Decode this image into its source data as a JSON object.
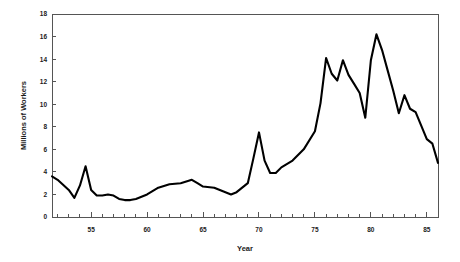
{
  "chart_data": {
    "type": "line",
    "title": "",
    "xlabel": "Year",
    "ylabel": "Millions of Workers",
    "xlim": [
      51.5,
      86.0
    ],
    "ylim": [
      0,
      18
    ],
    "ytick_step": 2,
    "xtick_step": 5,
    "xtick_minor_step": 1,
    "grid": false,
    "legend": "none",
    "yticks": [
      0,
      2,
      4,
      6,
      8,
      10,
      12,
      14,
      16,
      18
    ],
    "ytick_labels": [
      "0",
      "2",
      "4",
      "6",
      "8",
      "10",
      "12",
      "14",
      "16",
      "18"
    ],
    "xticks": [
      55,
      60,
      65,
      70,
      75,
      80,
      85
    ],
    "xtick_labels": [
      "55",
      "60",
      "65",
      "70",
      "75",
      "80",
      "85"
    ],
    "series": [
      {
        "name": "Workers",
        "x": [
          51.5,
          52,
          53,
          53.5,
          54,
          54.5,
          55,
          55.5,
          56,
          56.5,
          57,
          57.5,
          58,
          58.5,
          59,
          60,
          61,
          62,
          63,
          64,
          64.5,
          65,
          66,
          67,
          67.5,
          68,
          69,
          69.5,
          70,
          70.5,
          71,
          71.5,
          72,
          73,
          74,
          75,
          75.5,
          76,
          76.5,
          77,
          77.5,
          78,
          78.5,
          79,
          79.5,
          80,
          80.5,
          81,
          81.5,
          82,
          82.5,
          83,
          83.5,
          84,
          84.5,
          85,
          85.5,
          86
        ],
        "y": [
          3.6,
          3.3,
          2.4,
          1.7,
          2.8,
          4.5,
          2.4,
          1.9,
          1.9,
          2.0,
          1.9,
          1.6,
          1.5,
          1.5,
          1.6,
          2.0,
          2.6,
          2.9,
          3.0,
          3.3,
          3.0,
          2.7,
          2.6,
          2.2,
          2.0,
          2.2,
          3.0,
          5.2,
          7.5,
          5.0,
          3.9,
          3.9,
          4.4,
          5.0,
          6.0,
          7.6,
          10.1,
          14.1,
          12.7,
          12.1,
          13.9,
          12.6,
          11.8,
          11.0,
          8.8,
          13.9,
          16.2,
          14.8,
          13.0,
          11.2,
          9.2,
          10.8,
          9.6,
          9.3,
          8.1,
          6.9,
          6.5,
          4.8
        ]
      }
    ],
    "annotations": []
  },
  "geometry": {
    "plot_left": 52,
    "plot_right": 438,
    "plot_top": 14,
    "plot_bottom": 217
  }
}
